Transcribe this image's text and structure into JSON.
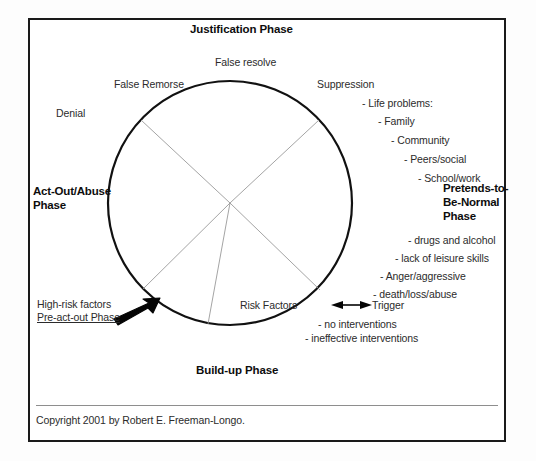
{
  "diagram": {
    "title_top": "Justification Phase",
    "title_bottom": "Build-up Phase",
    "title_left": "Act-Out/Abuse\nPhase",
    "title_right": "Pretends-to-\nBe-Normal\nPhase",
    "inner_label": "Risk Factors"
  },
  "labels": {
    "false_resolve": "False resolve",
    "false_remorse": "False Remorse",
    "denial": "Denial",
    "suppression": "Suppression",
    "risk_factors": "Risk Factors",
    "high_risk_factors": "High-risk factors",
    "pre_act_out_phase": "Pre-act-out Phase",
    "trigger": "Trigger"
  },
  "life_problems": [
    "- Life problems:",
    "- Family",
    "- Community",
    "- Peers/social",
    "- School/work"
  ],
  "pretends_items": [
    "- drugs and alcohol",
    "- lack of leisure skills",
    "- Anger/aggressive",
    "- death/loss/abuse"
  ],
  "intervention_items": [
    "- no interventions",
    "- ineffective interventions"
  ],
  "act_out_phase_lines": [
    "Act-Out/Abuse",
    "Phase"
  ],
  "pretends_phase_lines": [
    "Pretends-to-",
    "Be-Normal",
    "Phase"
  ],
  "copyright": "Copyright 2001 by Robert E. Freeman-Longo.",
  "colors": {
    "frame": "#1a1a1a",
    "circle": "#111111",
    "spokes": "#9a9a9a",
    "text": "#2b2b2b",
    "bold_text": "#0d0d0d",
    "rule": "#8e8e8e"
  },
  "geometry": {
    "circle_center_x": 230,
    "circle_center_y": 203,
    "circle_radius": 122
  }
}
